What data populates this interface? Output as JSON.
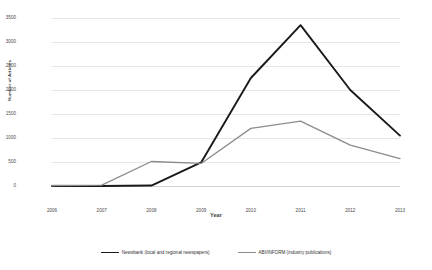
{
  "chart_data": {
    "type": "line",
    "title": "",
    "xlabel": "Year",
    "ylabel": "Number of Articles",
    "categories": [
      "2006",
      "2007",
      "2008",
      "2009",
      "2010",
      "2011",
      "2012",
      "2013"
    ],
    "ylim": [
      0,
      3500
    ],
    "yticks": [
      0,
      500,
      1000,
      1500,
      2000,
      2500,
      3000,
      3500
    ],
    "grid": "horizontal",
    "legend_position": "bottom",
    "series": [
      {
        "name": "Newsbank (local and regional newspapers)",
        "color": "#1a1a1a",
        "values": [
          0,
          0,
          10,
          490,
          2250,
          3350,
          2000,
          1050
        ]
      },
      {
        "name": "ABI/INFORM (industry publications)",
        "color": "#8c8c8c",
        "values": [
          10,
          20,
          510,
          470,
          1200,
          1350,
          850,
          570
        ]
      }
    ]
  }
}
